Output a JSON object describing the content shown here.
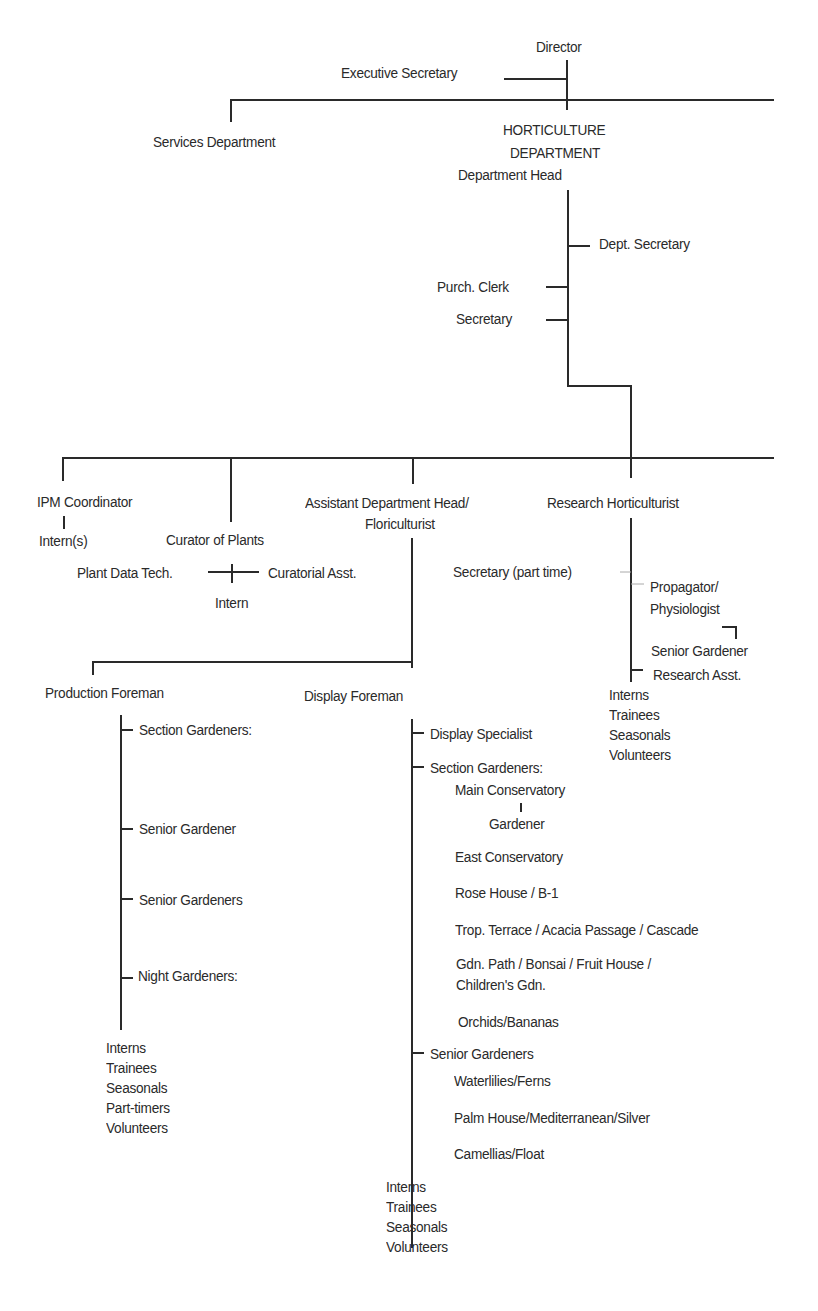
{
  "chart": {
    "line_color": "#2a2a2a",
    "text_color": "#2a2a2a",
    "top": {
      "director": "Director",
      "executive_secretary": "Executive Secretary",
      "services_department": "Services Department",
      "horticulture_line1": "HORTICULTURE",
      "horticulture_line2": "DEPARTMENT",
      "department_head": "Department Head"
    },
    "head_staff": {
      "dept_secretary": "Dept. Secretary",
      "purch_clerk": "Purch. Clerk",
      "secretary": "Secretary"
    },
    "divisions": {
      "ipm_coordinator": "IPM Coordinator",
      "ipm_interns": "Intern(s)",
      "curator_of_plants": "Curator of Plants",
      "plant_data_tech": "Plant Data Tech.",
      "curatorial_asst": "Curatorial Asst.",
      "curator_intern": "Intern",
      "assistant_head_line1": "Assistant Department Head/",
      "assistant_head_line2": "Floriculturist",
      "research_horticulturist": "Research Horticulturist"
    },
    "research": {
      "secretary_part_time": "Secretary (part time)",
      "propagator_line1": "Propagator/",
      "propagator_line2": "Physiologist",
      "senior_gardener": "Senior Gardener",
      "research_asst": "Research Asst.",
      "support": [
        "Interns",
        "Trainees",
        "Seasonals",
        "Volunteers"
      ]
    },
    "production": {
      "foreman": "Production Foreman",
      "section_gardeners": "Section Gardeners:",
      "senior_gardener": "Senior Gardener",
      "senior_gardeners": "Senior Gardeners",
      "night_gardeners": "Night Gardeners:",
      "support": [
        "Interns",
        "Trainees",
        "Seasonals",
        "Part-timers",
        "Volunteers"
      ]
    },
    "display": {
      "foreman": "Display Foreman",
      "display_specialist": "Display Specialist",
      "section_gardeners": "Section Gardeners:",
      "main_conservatory": "Main Conservatory",
      "gardener": "Gardener",
      "east_conservatory": "East Conservatory",
      "rose_house": "Rose House / B-1",
      "trop_terrace": "Trop. Terrace / Acacia Passage / Cascade",
      "gdn_path_line1": "Gdn. Path / Bonsai / Fruit House /",
      "gdn_path_line2": "Children's Gdn.",
      "orchids": "Orchids/Bananas",
      "senior_gardeners": "Senior Gardeners",
      "waterlilies": "Waterlilies/Ferns",
      "palm_house": "Palm House/Mediterranean/Silver",
      "camellias": "Camellias/Float",
      "support": [
        "Interns",
        "Trainees",
        "Seasonals",
        "Volunteers"
      ]
    }
  }
}
